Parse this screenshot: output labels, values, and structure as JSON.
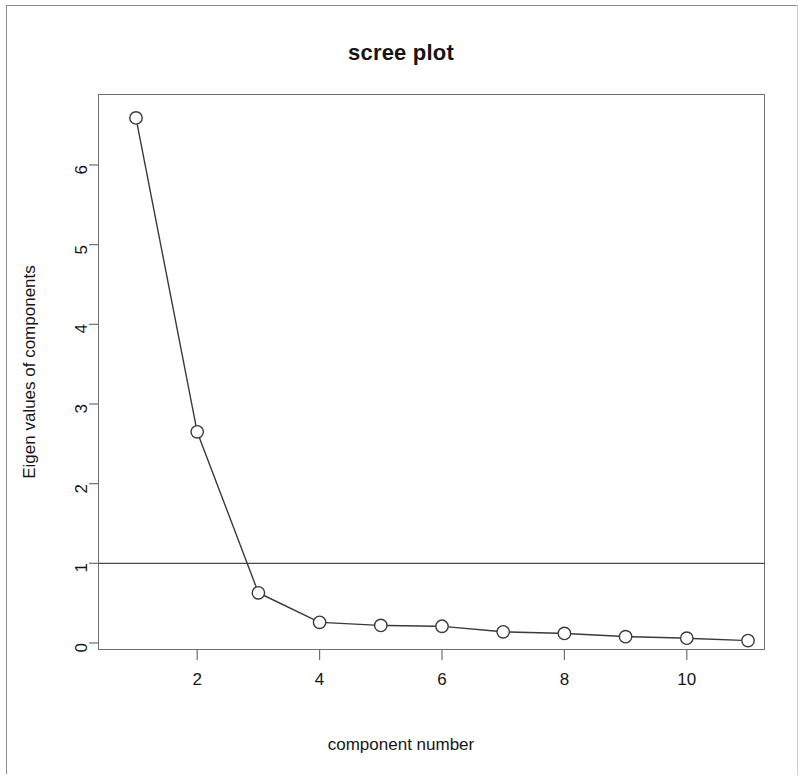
{
  "figure": {
    "title": "scree plot",
    "background_color": "#ffffff",
    "axis_color": "#6f6f6f",
    "marker_color": "#3a3a3a",
    "line_color": "#3a3a3a",
    "frame_color": "#8e8e8e"
  },
  "chart_data": {
    "type": "line",
    "title": "scree plot",
    "xlabel": "component number",
    "ylabel": "Eigen values of components",
    "x": [
      1,
      2,
      3,
      4,
      5,
      6,
      7,
      8,
      9,
      10,
      11
    ],
    "values": [
      6.59,
      2.65,
      0.63,
      0.26,
      0.22,
      0.21,
      0.14,
      0.12,
      0.08,
      0.06,
      0.03
    ],
    "series": [
      {
        "name": "Eigen values of components",
        "values": [
          6.59,
          2.65,
          0.63,
          0.26,
          0.22,
          0.21,
          0.14,
          0.12,
          0.08,
          0.06,
          0.03
        ]
      }
    ],
    "xlim": [
      0.6,
      11.4
    ],
    "ylim": [
      -0.1,
      6.9
    ],
    "xticks": [
      2,
      4,
      6,
      8,
      10
    ],
    "xtick_labels": [
      "2",
      "4",
      "6",
      "8",
      "10"
    ],
    "yticks": [
      0,
      1,
      2,
      3,
      4,
      5,
      6
    ],
    "ytick_labels": [
      "0",
      "1",
      "2",
      "3",
      "4",
      "5",
      "6"
    ],
    "grid": false,
    "legend": "none",
    "marker": "open-circle",
    "annotations": [
      {
        "type": "hline",
        "y": 1,
        "label": "eigenvalue = 1 cutoff"
      }
    ]
  },
  "axis": {
    "x_tick_labels": [
      "2",
      "4",
      "6",
      "8",
      "10"
    ],
    "y_tick_labels": [
      "0",
      "1",
      "2",
      "3",
      "4",
      "5",
      "6"
    ],
    "x_title": "component number",
    "y_title": "Eigen values of components"
  }
}
